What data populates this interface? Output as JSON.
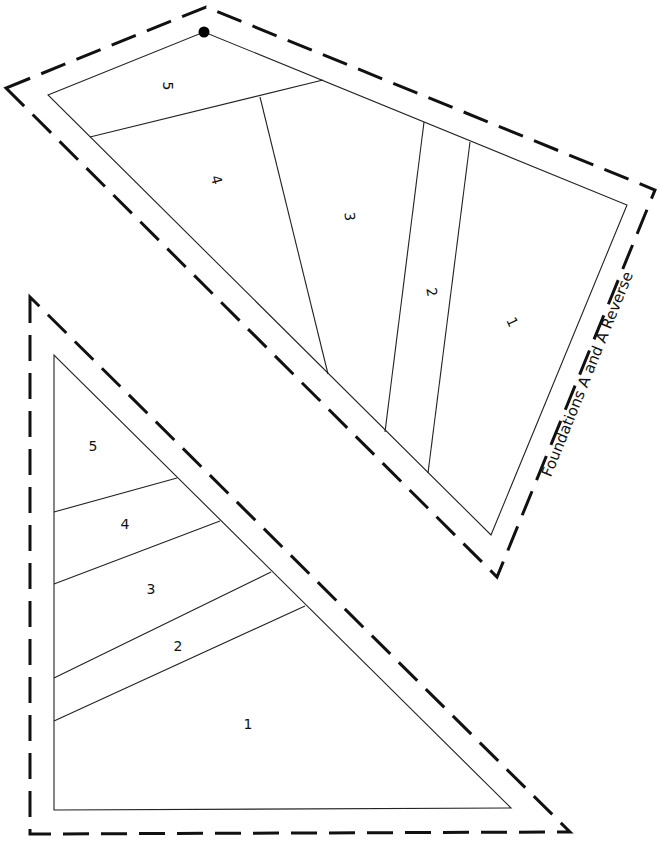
{
  "diagram": {
    "title": "Foundations A and A Reverse",
    "foundation_a": {
      "sections": [
        {
          "label": "5"
        },
        {
          "label": "4"
        },
        {
          "label": "3"
        },
        {
          "label": "2"
        },
        {
          "label": "1"
        }
      ]
    },
    "foundation_a_reverse": {
      "sections": [
        {
          "label": "5"
        },
        {
          "label": "4"
        },
        {
          "label": "3"
        },
        {
          "label": "2"
        },
        {
          "label": "1"
        }
      ]
    },
    "colors": {
      "line": "#222222",
      "background": "#ffffff"
    }
  }
}
